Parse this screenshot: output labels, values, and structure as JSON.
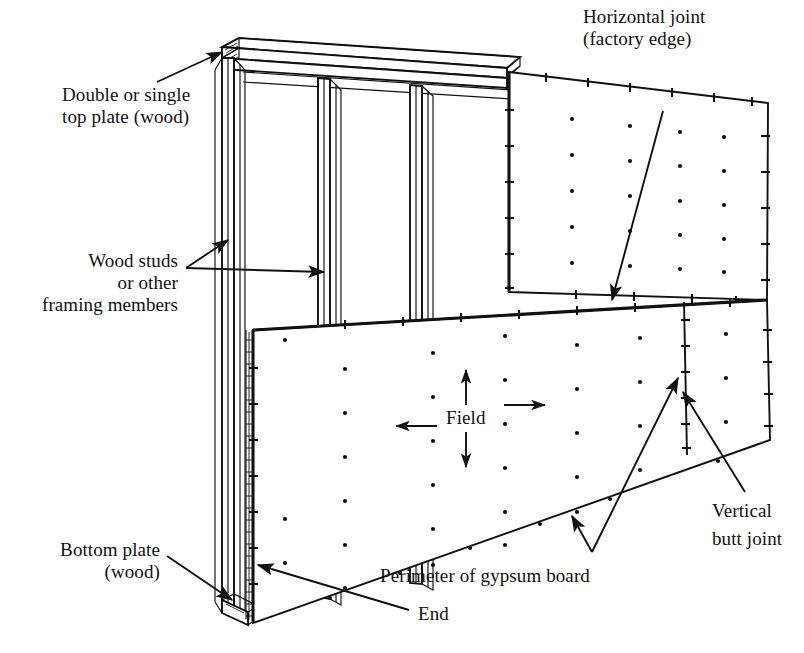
{
  "figure": {
    "background_color": "#ffffff",
    "line_color": "#111111"
  },
  "labels": {
    "top_plate": {
      "line1": "Double or single",
      "line2": "top plate (wood)"
    },
    "wood_studs": {
      "line1": "Wood studs",
      "line2": "or other",
      "line3": "framing members"
    },
    "bottom_plate": {
      "line1": "Bottom plate",
      "line2": "(wood)"
    },
    "horizontal_joint": {
      "line1": "Horizontal joint",
      "line2": "(factory edge)"
    },
    "vertical_butt_joint": {
      "line1": "Vertical",
      "line2": "butt joint"
    },
    "field": "Field",
    "perimeter": "Perimeter of gypsum board",
    "end": "End"
  },
  "components": {
    "top_plate_name": "double-or-single-top-plate",
    "bottom_plate_name": "bottom-plate",
    "stud_name": "wood-stud",
    "upper_panel_name": "upper-gypsum-panel",
    "lower_panel_name": "lower-gypsum-panel",
    "right_panel_name": "right-gypsum-panel"
  },
  "fasteners": {
    "field_dot_radius": 2.1,
    "perimeter_dash_length": 9,
    "description": "dots indicate field fasteners; short dashes indicate perimeter fasteners"
  },
  "geometry_notes": {
    "projection": "oblique / two-point perspective",
    "wall_left_x": 215,
    "wall_right_x": 772,
    "wall_top_y": 40,
    "wall_bottom_y": 628
  }
}
